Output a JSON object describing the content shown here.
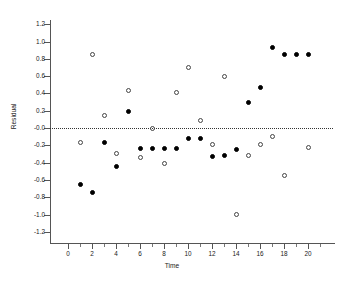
{
  "chart_data": {
    "type": "scatter",
    "title": "",
    "xlabel": "Time",
    "ylabel": "Residual",
    "xlim": [
      -1.2,
      22.2
    ],
    "ylim": [
      -1.3,
      1.3
    ],
    "xticks": [
      0,
      2,
      4,
      6,
      8,
      10,
      12,
      14,
      16,
      18,
      20
    ],
    "xticklabels": [
      "0",
      "2",
      "4",
      "6",
      "8",
      "10",
      "12",
      "14",
      "16",
      "18",
      "20"
    ],
    "yticks": [
      1.2,
      1.0,
      0.8,
      0.6,
      0.4,
      0.2,
      -0.0,
      -0.2,
      -0.4,
      -0.6,
      -0.8,
      -1.0,
      -1.2
    ],
    "yticklabels": [
      "1.2",
      "1.0",
      "0.8",
      "0.6",
      "0.4",
      "0.2",
      "-0.0",
      "-0.2",
      "-0.4",
      "-0.6",
      "-0.8",
      "-1.0",
      "-1.2"
    ],
    "grid": false,
    "legend": "none",
    "annotations": [
      {
        "kind": "hline",
        "y": 0.0,
        "style": "dotted",
        "color": "#333333"
      }
    ],
    "series": [
      {
        "name": "filled",
        "marker": "filled-circle",
        "color": "#000000",
        "points": [
          {
            "x": 1,
            "y": -0.65
          },
          {
            "x": 2,
            "y": -0.75
          },
          {
            "x": 3,
            "y": -0.17
          },
          {
            "x": 4,
            "y": -0.45
          },
          {
            "x": 5,
            "y": 0.19
          },
          {
            "x": 6,
            "y": -0.24
          },
          {
            "x": 7,
            "y": -0.24
          },
          {
            "x": 8,
            "y": -0.24
          },
          {
            "x": 9,
            "y": -0.24
          },
          {
            "x": 10,
            "y": -0.12
          },
          {
            "x": 11,
            "y": -0.12
          },
          {
            "x": 12,
            "y": -0.33
          },
          {
            "x": 13,
            "y": -0.32
          },
          {
            "x": 14,
            "y": -0.25
          },
          {
            "x": 15,
            "y": 0.29
          },
          {
            "x": 16,
            "y": 0.47
          },
          {
            "x": 17,
            "y": 0.93
          },
          {
            "x": 18,
            "y": 0.85
          },
          {
            "x": 19,
            "y": 0.85
          },
          {
            "x": 20,
            "y": 0.85
          }
        ]
      },
      {
        "name": "open",
        "marker": "open-circle",
        "color": "#444444",
        "points": [
          {
            "x": 1,
            "y": -0.17
          },
          {
            "x": 2,
            "y": 0.85
          },
          {
            "x": 3,
            "y": 0.15
          },
          {
            "x": 4,
            "y": -0.29
          },
          {
            "x": 5,
            "y": 0.43
          },
          {
            "x": 6,
            "y": -0.34
          },
          {
            "x": 7,
            "y": -0.01
          },
          {
            "x": 8,
            "y": -0.41
          },
          {
            "x": 9,
            "y": 0.41
          },
          {
            "x": 10,
            "y": 0.7
          },
          {
            "x": 11,
            "y": 0.09
          },
          {
            "x": 12,
            "y": -0.19
          },
          {
            "x": 13,
            "y": 0.59
          },
          {
            "x": 14,
            "y": -1.0
          },
          {
            "x": 15,
            "y": -0.32
          },
          {
            "x": 16,
            "y": -0.19
          },
          {
            "x": 17,
            "y": -0.1
          },
          {
            "x": 18,
            "y": -0.55
          },
          {
            "x": 20,
            "y": -0.23
          }
        ]
      }
    ]
  }
}
